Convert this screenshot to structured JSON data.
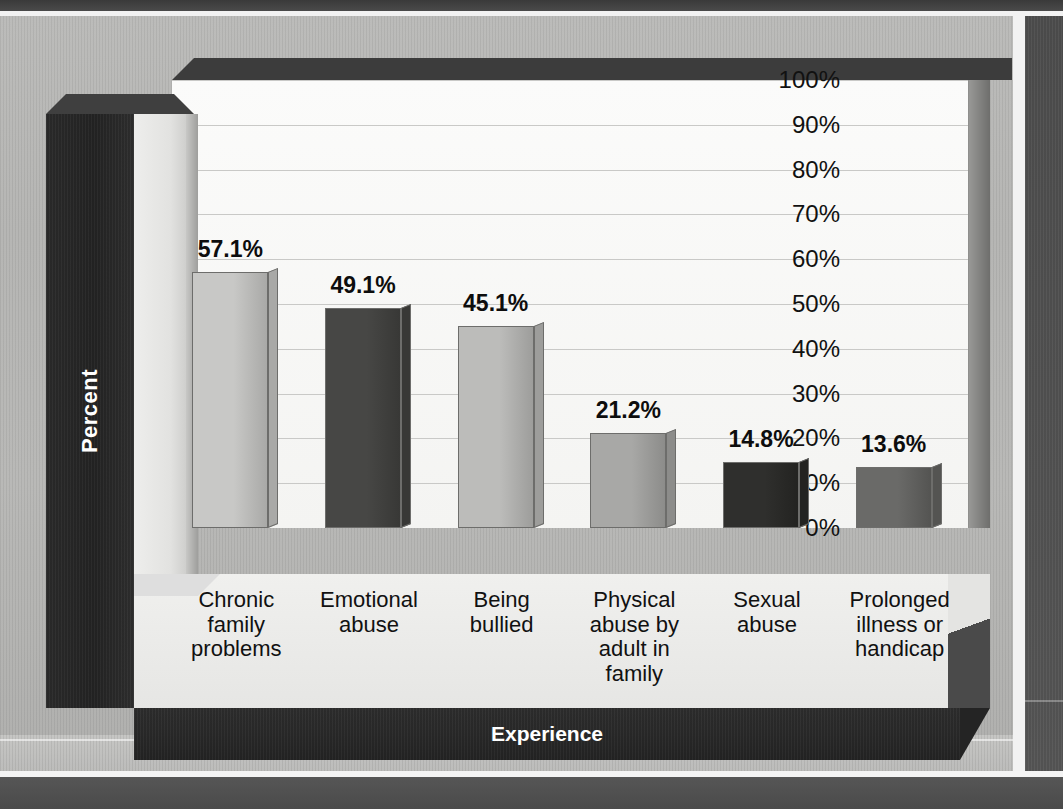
{
  "chart_data": {
    "type": "bar",
    "title": "",
    "xlabel": "Experience",
    "ylabel": "Percent",
    "ylim": [
      0,
      100
    ],
    "ytick_labels": [
      "100%",
      "90%",
      "80%",
      "70%",
      "60%",
      "50%",
      "40%",
      "30%",
      "20%",
      "10%",
      "0%"
    ],
    "ytick_values": [
      100,
      90,
      80,
      70,
      60,
      50,
      40,
      30,
      20,
      10,
      0
    ],
    "grid": true,
    "legend": "none",
    "categories": [
      "Chronic family problems",
      "Emotional abuse",
      "Being bullied",
      "Physical abuse by adult in family",
      "Sexual abuse",
      "Prolonged illness or handicap"
    ],
    "values": [
      57.1,
      49.1,
      45.1,
      21.2,
      14.8,
      13.6
    ],
    "data_labels": [
      "57.1%",
      "49.1%",
      "45.1%",
      "21.2%",
      "14.8%",
      "13.6%"
    ],
    "bars": [
      {
        "label_lines": [
          "Chronic",
          "family",
          "problems"
        ],
        "value": 57.1,
        "data_label": "57.1%",
        "fill": "#c8c8c6",
        "side": "#a9a9a7"
      },
      {
        "label_lines": [
          "Emotional",
          "abuse"
        ],
        "value": 49.1,
        "data_label": "49.1%",
        "fill": "#474745",
        "side": "#383836"
      },
      {
        "label_lines": [
          "Being",
          "bullied"
        ],
        "value": 45.1,
        "data_label": "45.1%",
        "fill": "#bcbcba",
        "side": "#9d9d9b"
      },
      {
        "label_lines": [
          "Physical",
          "abuse by",
          "adult in",
          "family"
        ],
        "value": 21.2,
        "data_label": "21.2%",
        "fill": "#a8a8a6",
        "side": "#8c8c8a"
      },
      {
        "label_lines": [
          "Sexual",
          "abuse"
        ],
        "value": 14.8,
        "data_label": "14.8%",
        "fill": "#2f2f2d",
        "side": "#232321"
      },
      {
        "label_lines": [
          "Prolonged",
          "illness or",
          "handicap"
        ],
        "value": 13.6,
        "data_label": "13.6%",
        "fill": "#6a6a68",
        "side": "#545452"
      }
    ]
  },
  "axis": {
    "y_title": "Percent",
    "x_title": "Experience"
  },
  "colors": {
    "page_background": "#b6b6b4",
    "plot_background": "#fbfbfa",
    "axis_block": "#2b2b2b",
    "gridline": "#c9c9c7",
    "text": "#111111"
  }
}
